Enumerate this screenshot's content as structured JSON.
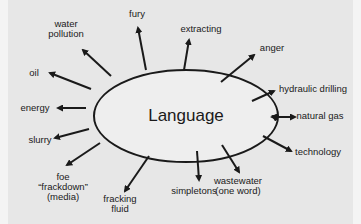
{
  "diagram": {
    "type": "mind-map",
    "center": {
      "label": "Language"
    },
    "colors": {
      "background": "#e7e7e7",
      "ink": "#1a1a1a"
    },
    "nodes": [
      {
        "id": "fury",
        "lines": [
          "fury"
        ]
      },
      {
        "id": "extracting",
        "lines": [
          "extracting"
        ]
      },
      {
        "id": "anger",
        "lines": [
          "anger"
        ]
      },
      {
        "id": "hydraulic-drilling",
        "lines": [
          "hydraulic drilling"
        ]
      },
      {
        "id": "natural-gas",
        "lines": [
          "natural gas"
        ]
      },
      {
        "id": "technology",
        "lines": [
          "technology"
        ]
      },
      {
        "id": "wastewater",
        "lines": [
          "wastewater",
          "(one word)"
        ]
      },
      {
        "id": "simpletons",
        "lines": [
          "simpletons"
        ]
      },
      {
        "id": "fracking-fluid",
        "lines": [
          "fracking",
          "fluid"
        ]
      },
      {
        "id": "foe-frackdown",
        "lines": [
          "foe",
          "“frackdown”",
          "(media)"
        ]
      },
      {
        "id": "slurry",
        "lines": [
          "slurry"
        ]
      },
      {
        "id": "energy",
        "lines": [
          "energy"
        ]
      },
      {
        "id": "oil",
        "lines": [
          "oil"
        ]
      },
      {
        "id": "water-pollution",
        "lines": [
          "water",
          "pollution"
        ]
      }
    ]
  }
}
